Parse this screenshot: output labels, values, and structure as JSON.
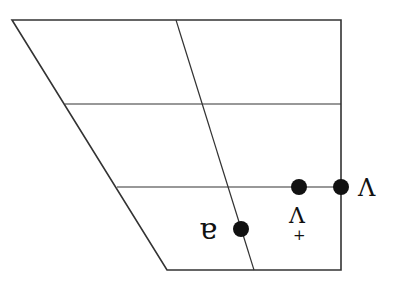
{
  "diagram": {
    "type": "IPA vowel trapezoid (rotated 180°)",
    "colors": {
      "line": "#333333",
      "dot": "#111111",
      "background": "#ffffff"
    },
    "trapezoid": {
      "top_left": [
        12,
        20
      ],
      "top_right": [
        341,
        20
      ],
      "bottom_right": [
        341,
        270
      ],
      "bottom_left": [
        167,
        270
      ]
    },
    "grid_lines": [
      {
        "x1": 65,
        "y1": 104,
        "x2": 341,
        "y2": 104
      },
      {
        "x1": 117,
        "y1": 187,
        "x2": 341,
        "y2": 187
      },
      {
        "x1": 176,
        "y1": 20,
        "x2": 254,
        "y2": 270
      }
    ],
    "points": [
      {
        "x": 241,
        "y": 229,
        "label": "ɐ"
      },
      {
        "x": 299,
        "y": 187,
        "label": "Λ",
        "diacritic": "+"
      },
      {
        "x": 341,
        "y": 187,
        "label": "Λ"
      }
    ],
    "labels": {
      "a_turned": "ɐ",
      "wedge_advanced": "Λ",
      "advanced_mark": "+",
      "wedge": "Λ"
    }
  }
}
